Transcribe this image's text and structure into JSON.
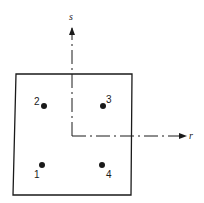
{
  "diagram": {
    "type": "quadrilateral element with integration points",
    "axes": {
      "s": {
        "label": "s",
        "direction": "up"
      },
      "r": {
        "label": "r",
        "direction": "right"
      }
    },
    "points": [
      {
        "label": "1",
        "quadrant": "bottom-left"
      },
      {
        "label": "2",
        "quadrant": "top-left"
      },
      {
        "label": "3",
        "quadrant": "top-right"
      },
      {
        "label": "4",
        "quadrant": "bottom-right"
      }
    ],
    "colors": {
      "stroke": "#1a1a1a",
      "background": "#ffffff"
    }
  }
}
